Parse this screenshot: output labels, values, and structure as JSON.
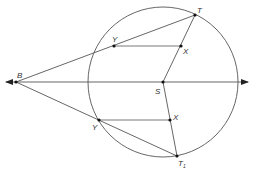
{
  "diagram": {
    "type": "geometry-construction",
    "colors": {
      "line": "#555555",
      "point": "#111111",
      "label": "#333333",
      "background": "#ffffff"
    },
    "labels": {
      "B": "B",
      "S": "S",
      "T": "T",
      "T1_main": "T",
      "T1_sub": "1",
      "Y_upper": "Y",
      "X_upper": "X",
      "Y_lower": "Y",
      "X_lower": "X"
    },
    "relations": [
      "B, Y (upper), T collinear",
      "B, Y (lower), T1 collinear",
      "S, X (upper), T collinear",
      "S, X (lower), T1 collinear",
      "Y(upper)X(upper) parallel to BS",
      "Y(lower)X(lower) parallel to BS",
      "Line BS extends in both directions (arrows)"
    ]
  }
}
